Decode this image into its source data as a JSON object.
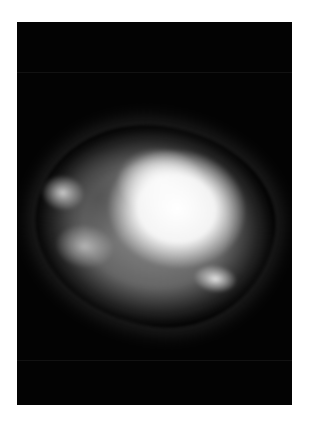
{
  "image": {
    "description": "Grayscale radiograph of an irregular specimen with a bright dense central region on a black background",
    "background_color": "#030303",
    "border_color": "#ffffff"
  }
}
